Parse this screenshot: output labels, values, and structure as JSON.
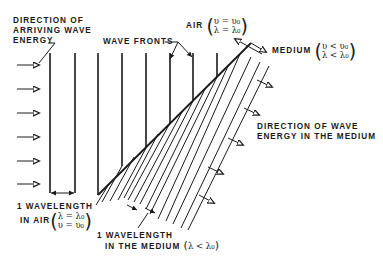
{
  "diagram": {
    "labels": {
      "arriving_direction": [
        "DIRECTION OF",
        "ARRIVING WAVE",
        "ENERGY"
      ],
      "wave_fronts": "WAVE FRONTS",
      "air": "AIR",
      "air_eq_1": "υ = υ₀",
      "air_eq_2": "λ = λ₀",
      "medium": "MEDIUM",
      "medium_eq_1": "υ < υ₀",
      "medium_eq_2": "λ < λ₀",
      "medium_direction": [
        "DIRECTION OF WAVE",
        "ENERGY IN THE MEDIUM"
      ],
      "wavelength_air": [
        "1 WAVELENGTH",
        "IN AIR"
      ],
      "wavelength_air_eq_1": "λ = λ₀",
      "wavelength_air_eq_2": "υ = υ₀",
      "wavelength_medium": [
        "1 WAVELENGTH",
        "IN THE MEDIUM"
      ],
      "wavelength_medium_eq": "λ < λ₀"
    },
    "colors": {
      "ink": "#1a1a1a",
      "background": "#ffffff"
    }
  }
}
